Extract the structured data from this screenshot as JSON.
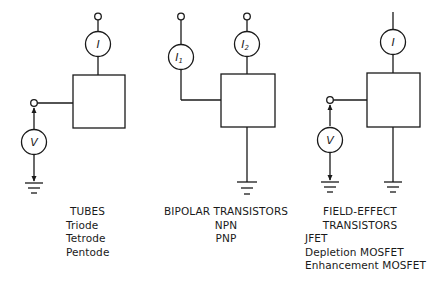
{
  "circuits": [
    {
      "id": "tubes",
      "meter_labels": [
        "I",
        "V"
      ],
      "title": "TUBES",
      "items": [
        "Triode",
        "Tetrode",
        "Pentode"
      ]
    },
    {
      "id": "bipolar",
      "meter_labels": [
        "I1",
        "I2"
      ],
      "title": "BIPOLAR TRANSISTORS",
      "items": [
        "NPN",
        "PNP"
      ]
    },
    {
      "id": "fet",
      "meter_labels": [
        "I",
        "V"
      ],
      "title_lines": [
        "FIELD-EFFECT",
        "TRANSISTORS"
      ],
      "items": [
        "JFET",
        "Depletion MOSFET",
        "Enhancement MOSFET"
      ]
    }
  ],
  "meters": {
    "tubes_current": "I",
    "tubes_voltage": "V",
    "bipolar_current_1": "I",
    "bipolar_current_1_sub": "1",
    "bipolar_current_2": "I",
    "bipolar_current_2_sub": "2",
    "fet_current": "I",
    "fet_voltage": "V"
  },
  "labels": {
    "tubes_title": "TUBES",
    "tubes_item_0": "Triode",
    "tubes_item_1": "Tetrode",
    "tubes_item_2": "Pentode",
    "bipolar_title": "BIPOLAR TRANSISTORS",
    "bipolar_item_0": "NPN",
    "bipolar_item_1": "PNP",
    "fet_title_0": "FIELD-EFFECT",
    "fet_title_1": "TRANSISTORS",
    "fet_item_0": "JFET",
    "fet_item_1": "Depletion MOSFET",
    "fet_item_2": "Enhancement MOSFET"
  }
}
